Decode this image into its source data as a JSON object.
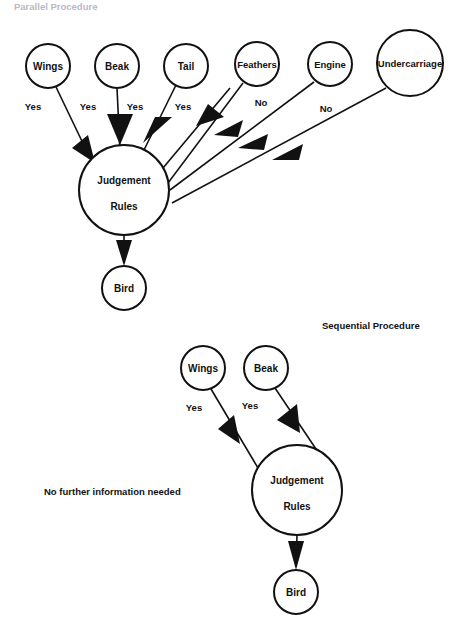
{
  "page": {
    "background_color": "#ffffff",
    "ink_color": "#111111",
    "width": 462,
    "height": 637
  },
  "sections": [
    {
      "id": "parallel",
      "title": "Parallel Procedure",
      "title_color": "#b9b9c4",
      "title_x": 14,
      "title_y": 7,
      "faded": true
    },
    {
      "id": "sequential",
      "title": "Sequential Procedure",
      "title_color": "#111111",
      "title_x": 322,
      "title_y": 326,
      "faded": false
    }
  ],
  "notes": [
    {
      "id": "no-further-info",
      "text": "No further information needed",
      "x": 44,
      "y": 492
    }
  ],
  "parallel_diagram": {
    "nodes": [
      {
        "id": "wings",
        "label": "Wings",
        "cx": 48,
        "cy": 66,
        "r": 22
      },
      {
        "id": "beak",
        "label": "Beak",
        "cx": 117,
        "cy": 66,
        "r": 22
      },
      {
        "id": "tail",
        "label": "Tail",
        "cx": 186,
        "cy": 66,
        "r": 22
      },
      {
        "id": "feathers",
        "label": "Feathers",
        "cx": 257,
        "cy": 64,
        "r": 22
      },
      {
        "id": "engine",
        "label": "Engine",
        "cx": 330,
        "cy": 64,
        "r": 22
      },
      {
        "id": "undercarriage",
        "label": "Undercarriage",
        "cx": 410,
        "cy": 63,
        "r": 33
      },
      {
        "id": "judgement",
        "label_line1": "Judgement",
        "label_line2": "Rules",
        "cx": 124,
        "cy": 190,
        "r": 45
      },
      {
        "id": "bird",
        "label": "Bird",
        "cx": 124,
        "cy": 288,
        "r": 22
      }
    ],
    "edges": [
      {
        "id": "wings-to-judgement",
        "from": "wings",
        "to": "judgement",
        "label": "Yes",
        "label_x": 33,
        "label_y": 107
      },
      {
        "id": "beak-to-judgement",
        "from": "beak",
        "to": "judgement",
        "label": "Yes",
        "label_x": 88,
        "label_y": 107
      },
      {
        "id": "tail-to-judgement",
        "from": "tail",
        "to": "judgement",
        "label": "Yes",
        "label_x": 135,
        "label_y": 107
      },
      {
        "id": "tail2-to-judgement",
        "from": "tail",
        "to": "judgement",
        "label": "Yes",
        "label_x": 183,
        "label_y": 107
      },
      {
        "id": "feathers-to-judgement",
        "from": "feathers",
        "to": "judgement",
        "label": "No",
        "label_x": 261,
        "label_y": 103
      },
      {
        "id": "engine-to-judgement",
        "from": "engine",
        "to": "judgement",
        "label": "No",
        "label_x": 326,
        "label_y": 109
      },
      {
        "id": "undercarriage-to-judgement",
        "from": "undercarriage",
        "to": "judgement",
        "label": "",
        "label_x": 0,
        "label_y": 0
      },
      {
        "id": "judgement-to-bird",
        "from": "judgement",
        "to": "bird",
        "label": "",
        "label_x": 0,
        "label_y": 0
      }
    ]
  },
  "sequential_diagram": {
    "nodes": [
      {
        "id": "seq-wings",
        "label": "Wings",
        "cx": 203,
        "cy": 368,
        "r": 22
      },
      {
        "id": "seq-beak",
        "label": "Beak",
        "cx": 266,
        "cy": 368,
        "r": 22
      },
      {
        "id": "seq-judgement",
        "label_line1": "Judgement",
        "label_line2": "Rules",
        "cx": 297,
        "cy": 490,
        "r": 45
      },
      {
        "id": "seq-bird",
        "label": "Bird",
        "cx": 296,
        "cy": 592,
        "r": 22
      }
    ],
    "edges": [
      {
        "id": "seq-wings-to-judgement",
        "from": "seq-wings",
        "to": "seq-judgement",
        "label": "Yes",
        "label_x": 194,
        "label_y": 408
      },
      {
        "id": "seq-beak-to-judgement",
        "from": "seq-beak",
        "to": "seq-judgement",
        "label": "Yes",
        "label_x": 250,
        "label_y": 406
      },
      {
        "id": "seq-judgement-to-bird",
        "from": "seq-judgement",
        "to": "seq-bird",
        "label": "",
        "label_x": 0,
        "label_y": 0
      }
    ]
  }
}
